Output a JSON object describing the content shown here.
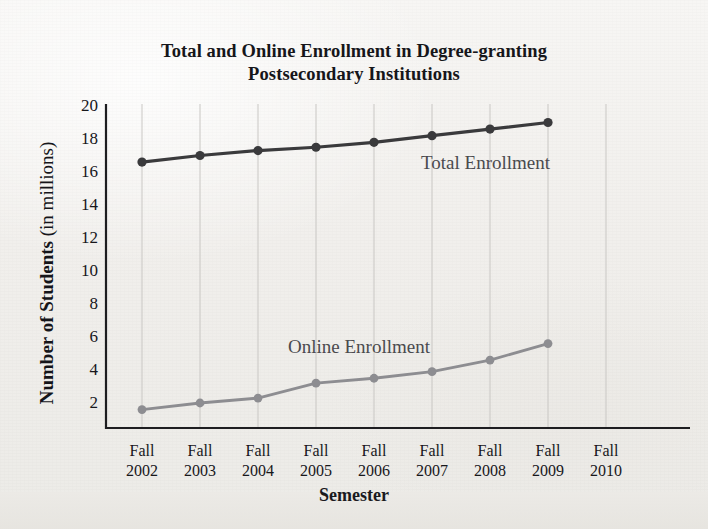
{
  "chart_data": {
    "type": "line",
    "title": "Total and Online Enrollment in Degree-granting Postsecondary Institutions",
    "title_line1": "Total and Online Enrollment in Degree-granting",
    "title_line2": "Postsecondary Institutions",
    "xlabel": "Semester",
    "ylabel": "Number of Students (in millions)",
    "ylabel_main": "Number of Students",
    "ylabel_unit": " (in millions)",
    "categories": [
      "Fall 2002",
      "Fall 2003",
      "Fall 2004",
      "Fall 2005",
      "Fall 2006",
      "Fall 2007",
      "Fall 2008",
      "Fall 2009",
      "Fall 2010"
    ],
    "category_lines": [
      {
        "term": "Fall",
        "year": "2002"
      },
      {
        "term": "Fall",
        "year": "2003"
      },
      {
        "term": "Fall",
        "year": "2004"
      },
      {
        "term": "Fall",
        "year": "2005"
      },
      {
        "term": "Fall",
        "year": "2006"
      },
      {
        "term": "Fall",
        "year": "2007"
      },
      {
        "term": "Fall",
        "year": "2008"
      },
      {
        "term": "Fall",
        "year": "2009"
      },
      {
        "term": "Fall",
        "year": "2010"
      }
    ],
    "yticks": [
      20,
      18,
      16,
      14,
      12,
      10,
      8,
      6,
      4,
      2
    ],
    "ylim": [
      0,
      20
    ],
    "grid": "vertical",
    "legend": "inline-annotations",
    "series": [
      {
        "name": "Total Enrollment",
        "color": "#3a3a3c",
        "values": [
          16.6,
          17.0,
          17.3,
          17.5,
          17.8,
          18.2,
          18.6,
          19.0,
          null
        ],
        "annotation": "Total Enrollment"
      },
      {
        "name": "Online Enrollment",
        "color": "#8d8d91",
        "values": [
          1.6,
          2.0,
          2.3,
          3.2,
          3.5,
          3.9,
          4.6,
          5.6,
          null
        ],
        "annotation": "Online Enrollment"
      }
    ]
  }
}
